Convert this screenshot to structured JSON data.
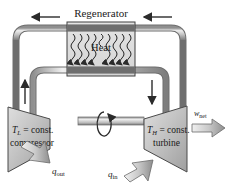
{
  "diagram": {
    "title": "Regenerator",
    "heat_label": "Heat",
    "compressor": {
      "temp_label": "T",
      "temp_sub": "L",
      "temp_eq": " = const.",
      "name": "compressor"
    },
    "turbine": {
      "temp_label": "T",
      "temp_sub": "H",
      "temp_eq": " = const.",
      "name": "turbine"
    },
    "work_out": {
      "symbol": "w",
      "sub": "net"
    },
    "heat_out": {
      "symbol": "q",
      "sub": "out"
    },
    "heat_in": {
      "symbol": "q",
      "sub": "in"
    },
    "colors": {
      "pipe_fill": "#b9b9b9",
      "pipe_light": "#e2e2e2",
      "pipe_dark": "#707070",
      "box_fill": "#cfcfcf",
      "device_fill": "#bdbdbd",
      "device_light": "#dcdcdc",
      "outline": "#4a4a4a",
      "text": "#1a1a1a",
      "arrow": "#2b2b2b"
    },
    "flow_arrows": [
      {
        "name": "top-left-arrow",
        "direction": "left"
      },
      {
        "name": "top-right-arrow",
        "direction": "left"
      },
      {
        "name": "left-riser-arrow",
        "direction": "up"
      },
      {
        "name": "right-downcomer-arrow",
        "direction": "down"
      },
      {
        "name": "shaft-rotation-arrow",
        "direction": "rotate"
      }
    ],
    "squiggle_count": 9
  }
}
